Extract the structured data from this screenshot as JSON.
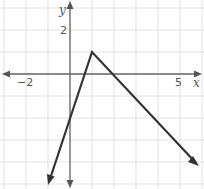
{
  "chart_data": {
    "type": "line",
    "title": "",
    "xlabel": "x",
    "ylabel": "y",
    "xlim": [
      -3,
      6
    ],
    "ylim": [
      -5,
      3
    ],
    "grid": true,
    "x_tick_labels": [
      {
        "value": -2,
        "label": "−2"
      },
      {
        "value": 5,
        "label": "5"
      }
    ],
    "y_tick_labels": [
      {
        "value": 2,
        "label": "2"
      }
    ],
    "series": [
      {
        "name": "piecewise linear function",
        "points": [
          [
            -1,
            -5
          ],
          [
            0,
            -2
          ],
          [
            1,
            1
          ],
          [
            2,
            0
          ],
          [
            4,
            -2
          ],
          [
            5.6,
            -3.9
          ]
        ],
        "vertex": [
          1,
          1
        ],
        "left_slope": 3,
        "right_slope": -1,
        "arrows_at_ends": true
      }
    ]
  },
  "labels": {
    "x_axis": "x",
    "y_axis": "y",
    "tick_neg2": "−2",
    "tick_5": "5",
    "tick_2": "2"
  },
  "colors": {
    "grid": "#e2e2e2",
    "axis": "#666666",
    "line": "#333333"
  }
}
